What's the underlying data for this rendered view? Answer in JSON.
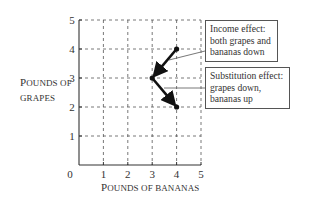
{
  "chart_data": {
    "type": "line",
    "title": "",
    "xlabel": "Pounds of bananas",
    "ylabel": "Pounds of grapes",
    "xlim": [
      0,
      5
    ],
    "ylim": [
      0,
      5
    ],
    "grid": true,
    "x_ticks": [
      "0",
      "1",
      "2",
      "3",
      "4",
      "5"
    ],
    "y_ticks": [
      "1",
      "2",
      "3",
      "4",
      "5"
    ],
    "points": [
      {
        "x": 4,
        "y": 4,
        "label": "start"
      },
      {
        "x": 3,
        "y": 3,
        "label": "after income effect"
      },
      {
        "x": 4,
        "y": 2,
        "label": "after substitution effect"
      }
    ],
    "arrows": [
      {
        "from": [
          4,
          4
        ],
        "to": [
          3,
          3
        ],
        "name": "Income effect"
      },
      {
        "from": [
          3,
          3
        ],
        "to": [
          4,
          2
        ],
        "name": "Substitution effect"
      }
    ],
    "annotations": [
      {
        "name": "income",
        "lines": [
          "Income effect:",
          "both grapes and",
          "bananas down"
        ]
      },
      {
        "name": "substitution",
        "lines": [
          "Substitution effect:",
          "grapes down,",
          "bananas up"
        ]
      }
    ]
  },
  "axes": {
    "y_title_line1_cap": "P",
    "y_title_line1_rest": "OUNDS OF",
    "y_title_line2": "GRAPES",
    "x_title_cap": "P",
    "x_title_rest": "OUNDS OF BANANAS",
    "origin_label": "0"
  }
}
